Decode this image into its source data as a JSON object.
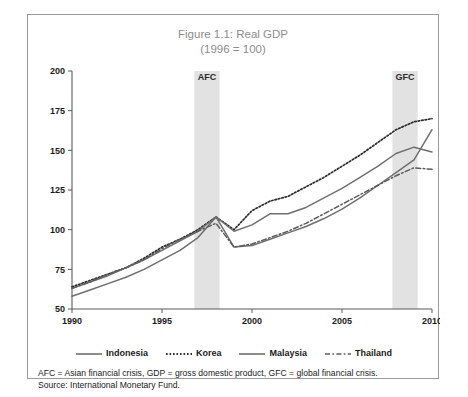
{
  "figure": {
    "title_line1": "Figure 1.1: Real GDP",
    "title_line2": "(1996 = 100)",
    "notes": [
      "AFC = Asian financial crisis, GDP = gross domestic product, GFC = global financial crisis.",
      "Source: International Monetary Fund."
    ]
  },
  "chart_data": {
    "type": "line",
    "title": "Figure 1.1: Real GDP (1996 = 100)",
    "xlabel": "",
    "ylabel": "",
    "xlim": [
      1990,
      2010
    ],
    "ylim": [
      50,
      200
    ],
    "yticks": [
      50,
      75,
      100,
      125,
      150,
      175,
      200
    ],
    "xticks": [
      1990,
      1995,
      2000,
      2005,
      2010
    ],
    "grid": false,
    "legend_position": "below",
    "x": [
      1990,
      1991,
      1992,
      1993,
      1994,
      1995,
      1996,
      1997,
      1998,
      1999,
      2000,
      2001,
      2002,
      2003,
      2004,
      2005,
      2006,
      2007,
      2008,
      2009,
      2010
    ],
    "series": [
      {
        "name": "Indonesia",
        "style": "solid",
        "color": "#6f6f6f",
        "values": [
          58,
          62,
          66,
          70,
          75,
          81,
          87,
          95,
          108,
          89,
          90,
          94,
          98,
          102,
          107,
          113,
          120,
          128,
          136,
          144,
          163
        ]
      },
      {
        "name": "Korea",
        "style": "dotted",
        "color": "#2b2b2b",
        "values": [
          64,
          68,
          72,
          76,
          82,
          89,
          94,
          100,
          108,
          100,
          112,
          118,
          121,
          127,
          133,
          140,
          147,
          155,
          163,
          168,
          170
        ]
      },
      {
        "name": "Malaysia",
        "style": "solid",
        "color": "#6f6f6f",
        "values": [
          63,
          67,
          71,
          76,
          81,
          87,
          93,
          99,
          108,
          99,
          103,
          110,
          110,
          114,
          120,
          126,
          133,
          140,
          148,
          152,
          149
        ]
      },
      {
        "name": "Thailand",
        "style": "dash-dot",
        "color": "#5c5c5c",
        "values": [
          63,
          67,
          72,
          76,
          81,
          88,
          94,
          99,
          104,
          89,
          91,
          95,
          99,
          104,
          110,
          116,
          122,
          128,
          134,
          139,
          138
        ]
      }
    ],
    "annotations": [
      {
        "label": "AFC",
        "type": "vertical-band",
        "x_start": 1996.8,
        "x_end": 1998.2
      },
      {
        "label": "GFC",
        "type": "vertical-band",
        "x_start": 2007.8,
        "x_end": 2009.2
      }
    ]
  },
  "legend": {
    "items": [
      {
        "label": "Indonesia",
        "style": "solid"
      },
      {
        "label": "Korea",
        "style": "dotted"
      },
      {
        "label": "Malaysia",
        "style": "solid"
      },
      {
        "label": "Thailand",
        "style": "dash-dot"
      }
    ]
  }
}
